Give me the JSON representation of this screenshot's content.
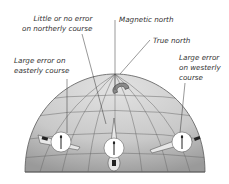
{
  "diagram": {
    "labels": {
      "little_error": [
        "Little or no error",
        "on northerly course"
      ],
      "magnetic_north": "Magnetic north",
      "true_north": "True north",
      "large_error_east": [
        "Large error on",
        "easterly course"
      ],
      "large_error_west": [
        "Large error",
        "on westerly",
        "course"
      ]
    },
    "elements": {
      "globe": "hemisphere-with-grid",
      "magnet": "horseshoe-magnet-icon",
      "aircraft": [
        "aircraft-easterly",
        "aircraft-northerly",
        "aircraft-westerly"
      ]
    },
    "colors": {
      "globe_fill": "#cfcfcf",
      "globe_shade": "#a8a8a8",
      "grid": "#6a6a6a",
      "text": "#333333",
      "compass_face": "#ffffff"
    }
  }
}
